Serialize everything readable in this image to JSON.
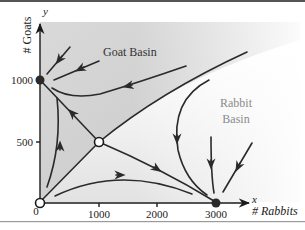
{
  "axes": {
    "x": {
      "var": "x",
      "label": "# Rabbits",
      "ticks": [
        "0",
        "1000",
        "2000",
        "3000"
      ]
    },
    "y": {
      "var": "y",
      "label": "# Goats",
      "ticks": [
        "500",
        "1000"
      ]
    }
  },
  "regions": {
    "goat_basin": {
      "label": "Goat Basin",
      "color": "#c8c8c8"
    },
    "rabbit_basin": {
      "label_line1": "Rabbit",
      "label_line2": "Basin",
      "color": "#e6e6e6"
    }
  },
  "equilibria": [
    {
      "name": "origin",
      "x": 0,
      "y": 0,
      "type": "unstable",
      "style": "open"
    },
    {
      "name": "goat-node",
      "x": 0,
      "y": 1000,
      "type": "stable",
      "style": "filled"
    },
    {
      "name": "saddle",
      "x": 1000,
      "y": 500,
      "type": "saddle",
      "style": "open"
    },
    {
      "name": "rabbit-node",
      "x": 3000,
      "y": 0,
      "type": "stable",
      "style": "filled"
    }
  ],
  "colors": {
    "line": "#2a2a2a",
    "goat_region": "#c8c8c8",
    "rabbit_region": "#e6e6e6",
    "border_top": "#555555",
    "border_bottom": "#9a9a9a"
  }
}
